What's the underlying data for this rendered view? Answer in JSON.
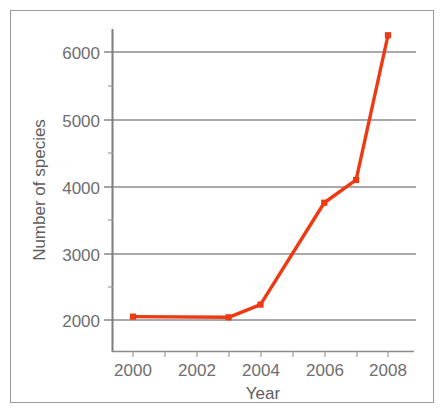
{
  "chart_data": {
    "type": "line",
    "title": "",
    "xlabel": "Year",
    "ylabel": "Number of species",
    "x": [
      2000,
      2003,
      2004,
      2006,
      2007,
      2008
    ],
    "values": [
      2050,
      2040,
      2230,
      3750,
      4090,
      6250
    ],
    "series": [
      {
        "name": "Number of species",
        "x": [
          2000,
          2003,
          2004,
          2006,
          2007,
          2008
        ],
        "values": [
          2050,
          2040,
          2230,
          3750,
          4090,
          6250
        ]
      }
    ],
    "xlim": [
      1999,
      2008.6
    ],
    "ylim": [
      1550,
      6550
    ],
    "xticks": [
      2000,
      2001,
      2002,
      2003,
      2004,
      2005,
      2006,
      2007,
      2008
    ],
    "xtick_labels": [
      "2000",
      "",
      "2002",
      "",
      "2004",
      "",
      "2006",
      "",
      "2008"
    ],
    "yticks": [
      2000,
      2500,
      3000,
      3500,
      4000,
      4500,
      5000,
      5500,
      6000
    ],
    "ytick_labels": [
      "2000",
      "",
      "3000",
      "",
      "4000",
      "",
      "5000",
      "",
      "6000"
    ],
    "grid": "horizontal-major",
    "legend": "none",
    "line_color": "#ee3a13",
    "marker": "square",
    "marker_color": "#ee3a13",
    "grid_color": "#8c8c8c",
    "axis_color": "#7d7d7d",
    "text_color": "#6e6e6e"
  },
  "axis": {
    "x_title": "Year",
    "y_title": "Number of species",
    "y_labels": [
      "6000",
      "5000",
      "4000",
      "3000",
      "2000"
    ],
    "x_labels": [
      "2000",
      "2002",
      "2004",
      "2006",
      "2008"
    ]
  }
}
